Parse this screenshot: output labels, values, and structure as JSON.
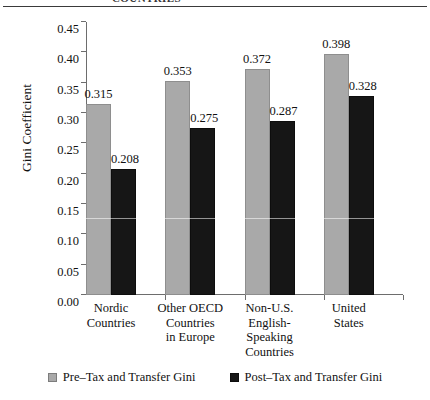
{
  "caption": {
    "clipped_header": "COUNTRIES"
  },
  "chart_data": {
    "type": "bar",
    "title": "",
    "xlabel": "",
    "ylabel": "Gini Coefficient",
    "ylim": [
      0.0,
      0.45
    ],
    "ytick_labels": [
      "0.00",
      "0.05",
      "0.10",
      "0.15",
      "0.20",
      "0.25",
      "0.30",
      "0.35",
      "0.40",
      "0.45"
    ],
    "ytick_values": [
      0.0,
      0.05,
      0.1,
      0.15,
      0.2,
      0.25,
      0.3,
      0.35,
      0.4,
      0.45
    ],
    "grid": false,
    "legend_position": "bottom",
    "categories": [
      "Nordic\nCountries",
      "Other OECD\nCountries\nin Europe",
      "Non-U.S.\nEnglish-\nSpeaking\nCountries",
      "United\nStates"
    ],
    "category_lines": [
      [
        "Nordic",
        "Countries"
      ],
      [
        "Other OECD",
        "Countries",
        "in Europe"
      ],
      [
        "Non-U.S.",
        "English-",
        "Speaking",
        "Countries"
      ],
      [
        "United",
        "States"
      ]
    ],
    "series": [
      {
        "name": "Pre–Tax and Transfer Gini",
        "color": "#a9a9a9",
        "values": [
          0.315,
          0.353,
          0.372,
          0.398
        ],
        "labels": [
          "0.315",
          "0.353",
          "0.372",
          "0.398"
        ]
      },
      {
        "name": "Post–Tax and Transfer Gini",
        "color": "#161616",
        "values": [
          0.208,
          0.275,
          0.287,
          0.328
        ],
        "labels": [
          "0.208",
          "0.275",
          "0.287",
          "0.328"
        ]
      }
    ]
  },
  "colors": {
    "pre_tax": "#a9a9a9",
    "post_tax": "#161616",
    "axis": "#6d6d6d",
    "text": "#111111",
    "background": "#ffffff"
  }
}
